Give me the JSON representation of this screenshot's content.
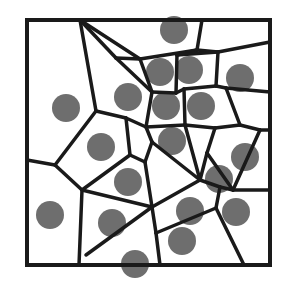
{
  "diagram": {
    "type": "voronoi",
    "width": 296,
    "height": 285,
    "colors": {
      "background": "#ffffff",
      "edge": "#1a1a1a",
      "site": "#6e6e6e"
    },
    "border": {
      "x1": 27,
      "y1": 20,
      "x2": 270,
      "y2": 265
    },
    "site_radius": 14,
    "sites": [
      {
        "x": 66,
        "y": 108
      },
      {
        "x": 128,
        "y": 97
      },
      {
        "x": 174,
        "y": 30
      },
      {
        "x": 160,
        "y": 72
      },
      {
        "x": 189,
        "y": 70
      },
      {
        "x": 240,
        "y": 78
      },
      {
        "x": 166,
        "y": 106
      },
      {
        "x": 201,
        "y": 106
      },
      {
        "x": 101,
        "y": 147
      },
      {
        "x": 172,
        "y": 141
      },
      {
        "x": 128,
        "y": 182
      },
      {
        "x": 245,
        "y": 157
      },
      {
        "x": 219,
        "y": 179
      },
      {
        "x": 50,
        "y": 215
      },
      {
        "x": 112,
        "y": 223
      },
      {
        "x": 190,
        "y": 211
      },
      {
        "x": 236,
        "y": 212
      },
      {
        "x": 182,
        "y": 241
      },
      {
        "x": 135,
        "y": 264
      }
    ],
    "edges": [
      [
        [
          80,
          20
        ],
        [
          96,
          111
        ]
      ],
      [
        [
          80,
          20
        ],
        [
          140,
          59
        ]
      ],
      [
        [
          80,
          20
        ],
        [
          116,
          58
        ]
      ],
      [
        [
          116,
          58
        ],
        [
          140,
          59
        ]
      ],
      [
        [
          140,
          59
        ],
        [
          197,
          50
        ]
      ],
      [
        [
          197,
          50
        ],
        [
          202,
          20
        ]
      ],
      [
        [
          197,
          50
        ],
        [
          218,
          52
        ]
      ],
      [
        [
          218,
          52
        ],
        [
          270,
          42
        ]
      ],
      [
        [
          140,
          59
        ],
        [
          152,
          92
        ]
      ],
      [
        [
          116,
          58
        ],
        [
          152,
          92
        ]
      ],
      [
        [
          152,
          92
        ],
        [
          176,
          93
        ]
      ],
      [
        [
          176,
          93
        ],
        [
          177,
          55
        ]
      ],
      [
        [
          177,
          55
        ],
        [
          197,
          50
        ]
      ],
      [
        [
          177,
          55
        ],
        [
          218,
          52
        ]
      ],
      [
        [
          218,
          52
        ],
        [
          216,
          86
        ]
      ],
      [
        [
          176,
          93
        ],
        [
          184,
          89
        ]
      ],
      [
        [
          184,
          89
        ],
        [
          216,
          86
        ]
      ],
      [
        [
          216,
          86
        ],
        [
          226,
          88
        ]
      ],
      [
        [
          152,
          92
        ],
        [
          146,
          127
        ]
      ],
      [
        [
          96,
          111
        ],
        [
          126,
          118
        ]
      ],
      [
        [
          126,
          118
        ],
        [
          146,
          127
        ]
      ],
      [
        [
          146,
          127
        ],
        [
          185,
          125
        ]
      ],
      [
        [
          184,
          89
        ],
        [
          185,
          125
        ]
      ],
      [
        [
          185,
          125
        ],
        [
          215,
          128
        ]
      ],
      [
        [
          226,
          88
        ],
        [
          270,
          92
        ]
      ],
      [
        [
          226,
          88
        ],
        [
          240,
          125
        ]
      ],
      [
        [
          240,
          125
        ],
        [
          215,
          128
        ]
      ],
      [
        [
          240,
          125
        ],
        [
          260,
          130
        ]
      ],
      [
        [
          260,
          130
        ],
        [
          270,
          130
        ]
      ],
      [
        [
          96,
          111
        ],
        [
          55,
          165
        ]
      ],
      [
        [
          27,
          160
        ],
        [
          55,
          165
        ]
      ],
      [
        [
          55,
          165
        ],
        [
          82,
          190
        ]
      ],
      [
        [
          126,
          118
        ],
        [
          130,
          155
        ]
      ],
      [
        [
          130,
          155
        ],
        [
          145,
          162
        ]
      ],
      [
        [
          146,
          127
        ],
        [
          152,
          142
        ]
      ],
      [
        [
          152,
          142
        ],
        [
          145,
          162
        ]
      ],
      [
        [
          152,
          142
        ],
        [
          200,
          180
        ]
      ],
      [
        [
          185,
          125
        ],
        [
          200,
          180
        ]
      ],
      [
        [
          215,
          128
        ],
        [
          207,
          153
        ]
      ],
      [
        [
          207,
          153
        ],
        [
          233,
          190
        ]
      ],
      [
        [
          233,
          190
        ],
        [
          260,
          130
        ]
      ],
      [
        [
          233,
          190
        ],
        [
          270,
          190
        ]
      ],
      [
        [
          130,
          155
        ],
        [
          82,
          190
        ]
      ],
      [
        [
          82,
          190
        ],
        [
          79,
          265
        ]
      ],
      [
        [
          82,
          190
        ],
        [
          152,
          207
        ]
      ],
      [
        [
          145,
          162
        ],
        [
          152,
          207
        ]
      ],
      [
        [
          152,
          207
        ],
        [
          200,
          180
        ]
      ],
      [
        [
          200,
          180
        ],
        [
          220,
          187
        ]
      ],
      [
        [
          220,
          187
        ],
        [
          233,
          190
        ]
      ],
      [
        [
          207,
          153
        ],
        [
          200,
          180
        ]
      ],
      [
        [
          86,
          255
        ],
        [
          152,
          207
        ]
      ],
      [
        [
          152,
          207
        ],
        [
          156,
          233
        ]
      ],
      [
        [
          156,
          233
        ],
        [
          160,
          265
        ]
      ],
      [
        [
          156,
          233
        ],
        [
          216,
          208
        ]
      ],
      [
        [
          216,
          208
        ],
        [
          220,
          187
        ]
      ],
      [
        [
          216,
          208
        ],
        [
          244,
          265
        ]
      ]
    ]
  }
}
